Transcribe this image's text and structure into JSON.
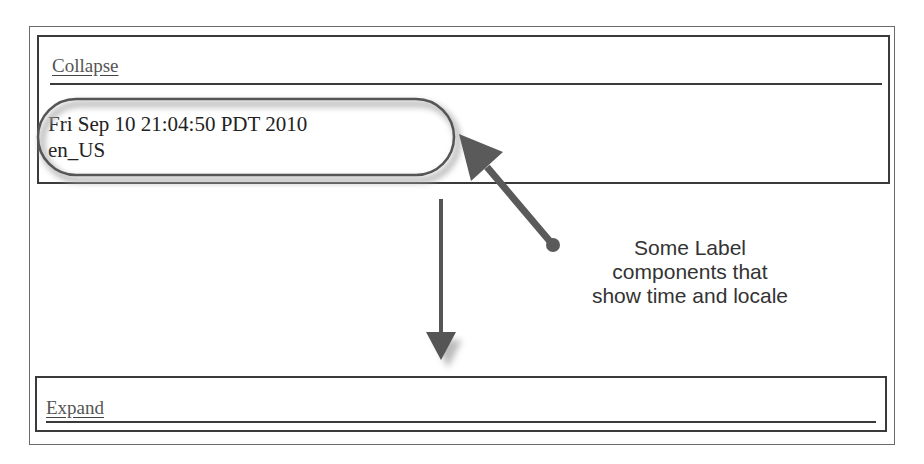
{
  "top_panel": {
    "collapse_link": "Collapse",
    "labels": {
      "time": "Fri Sep 10 21:04:50 PDT 2010",
      "locale": "en_US"
    }
  },
  "bottom_panel": {
    "expand_link": "Expand"
  },
  "annotation": {
    "callout_text": "Some Label components that show time and locale",
    "color": "#5a5a5a"
  }
}
